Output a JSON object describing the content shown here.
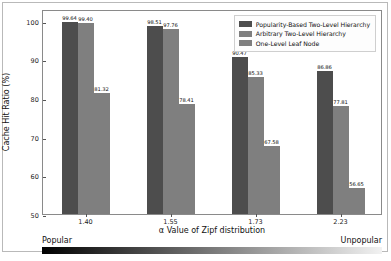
{
  "chart_data": {
    "type": "bar",
    "title": "",
    "xlabel": "α Value of Zipf distribution",
    "ylabel": "Cache Hit Ratio (%)",
    "categories": [
      "1.40",
      "1.55",
      "1.73",
      "2.23"
    ],
    "ylim": [
      50,
      103
    ],
    "yticks": [
      "100",
      "90",
      "80",
      "70",
      "60",
      "50"
    ],
    "grid": false,
    "legend_position": "upper right",
    "series": [
      {
        "name": "Popularity-Based Two-Level Hierarchy",
        "color": "#4d4d4d",
        "values": [
          99.64,
          98.51,
          90.47,
          86.86
        ],
        "labels": [
          "99.64",
          "98.51",
          "90.47",
          "86.86"
        ]
      },
      {
        "name": "Arbitrary Two-Level Hierarchy",
        "color": "#7f7f7f",
        "values": [
          99.4,
          97.76,
          85.33,
          77.81
        ],
        "labels": [
          "99.40",
          "97.76",
          "85.33",
          "77.81"
        ]
      },
      {
        "name": "One-Level Leaf Node",
        "color": "#7f7f7f",
        "values": [
          81.32,
          78.41,
          67.58,
          56.65
        ],
        "labels": [
          "81.32",
          "78.41",
          "67.58",
          "56.65"
        ]
      }
    ],
    "annotations": {
      "popularity_axis_left": "Popular",
      "popularity_axis_right": "Unpopular",
      "popularity_gradient_from": "#000000",
      "popularity_gradient_to": "#f2f2f2"
    }
  }
}
